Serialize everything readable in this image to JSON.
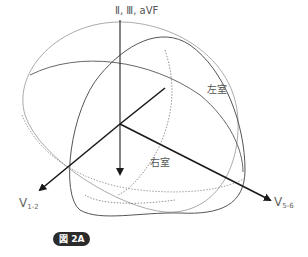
{
  "figure": {
    "badge_label": "図 2A",
    "top_axis_label": "Ⅱ, Ⅲ, aVF",
    "left_ventricle_label": "左室",
    "right_ventricle_label": "右室",
    "axis_v12": {
      "main": "V",
      "sub": "1-2"
    },
    "axis_v56": {
      "main": "V",
      "sub": "5-6"
    }
  },
  "colors": {
    "thick_line": "#1a1a1a",
    "ellipse_outer": "#999999",
    "ellipse_inner": "#555555",
    "text": "#555555",
    "badge_bg": "#2b2b2b"
  }
}
